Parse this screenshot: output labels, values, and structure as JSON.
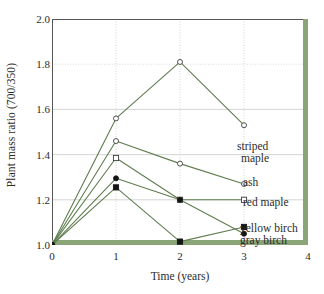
{
  "chart_data": {
    "type": "line",
    "title": "",
    "xlabel": "Time (years)",
    "ylabel": "Plant mass ratio (700/350)",
    "xlim": [
      0,
      4
    ],
    "ylim": [
      1.0,
      2.0
    ],
    "xticks": [
      "0",
      "1",
      "2",
      "3",
      "4"
    ],
    "xtick_values": [
      0,
      1,
      2,
      3,
      4
    ],
    "yticks": [
      "1.0",
      "1.2",
      "1.4",
      "1.6",
      "1.8",
      "2.0"
    ],
    "ytick_values": [
      1.0,
      1.2,
      1.4,
      1.6,
      1.8,
      2.0
    ],
    "grid": true,
    "legend_position": "right-inline-annotations",
    "line_color": "#5f7d4f",
    "axis_color": "#8aa578",
    "series": [
      {
        "name": "striped maple",
        "marker": "open-circle",
        "x": [
          0,
          1,
          2,
          3
        ],
        "values": [
          1.0,
          1.56,
          1.81,
          1.53
        ]
      },
      {
        "name": "ash",
        "marker": "open-circle",
        "x": [
          0,
          1,
          2,
          3
        ],
        "values": [
          1.0,
          1.46,
          1.36,
          1.27
        ]
      },
      {
        "name": "red maple",
        "marker": "open-square",
        "x": [
          0,
          1,
          2,
          3
        ],
        "values": [
          1.0,
          1.385,
          1.2,
          1.2
        ]
      },
      {
        "name": "yellow birch",
        "marker": "filled-square",
        "x": [
          0,
          1,
          2,
          3
        ],
        "values": [
          1.0,
          1.255,
          1.015,
          1.08
        ]
      },
      {
        "name": "gray birch",
        "marker": "filled-circle",
        "x": [
          0,
          1,
          2,
          3
        ],
        "values": [
          1.0,
          1.295,
          1.2,
          1.05
        ]
      }
    ],
    "annotations": [
      {
        "text": "striped",
        "series": "striped maple"
      },
      {
        "text": "maple",
        "series": "striped maple"
      },
      {
        "text": "ash",
        "series": "ash"
      },
      {
        "text": "red maple",
        "series": "red maple"
      },
      {
        "text": "yellow birch",
        "series": "yellow birch"
      },
      {
        "text": "gray birch",
        "series": "gray birch"
      }
    ]
  },
  "labels": {
    "striped_line1": "striped",
    "striped_line2": "maple",
    "ash": "ash",
    "red_maple": "red maple",
    "yellow_birch": "yellow birch",
    "gray_birch": "gray birch"
  }
}
